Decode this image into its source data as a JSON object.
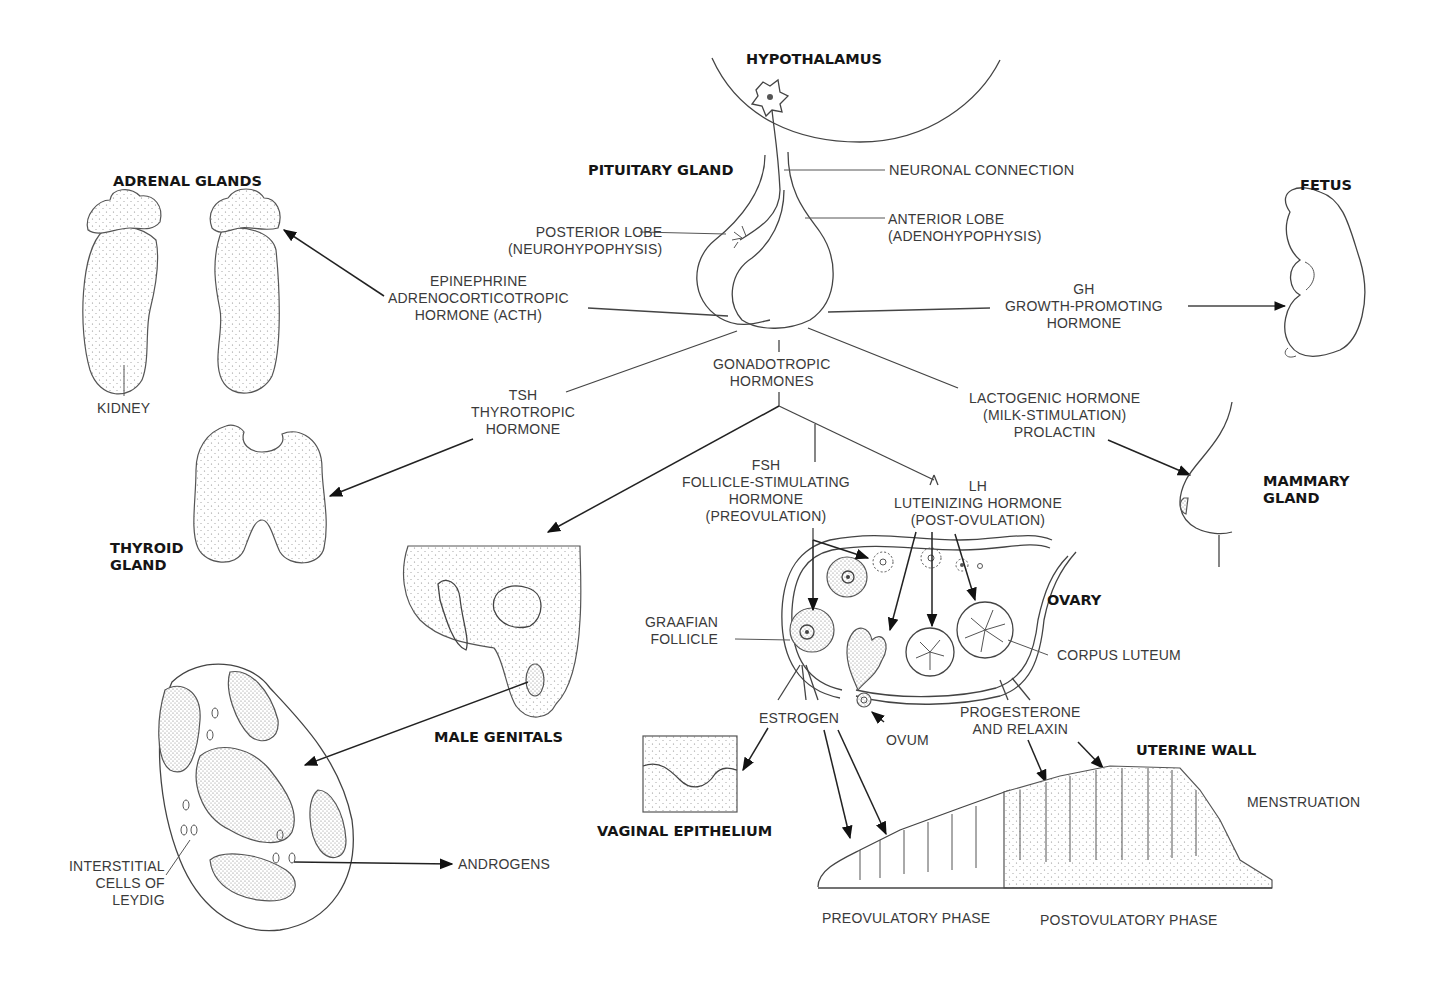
{
  "diagram": {
    "nodes": {
      "hypothalamus": "HYPOTHALAMUS",
      "pituitary": "PITUITARY GLAND",
      "neuronal_connection": "NEURONAL CONNECTION",
      "posterior_lobe": "POSTERIOR LOBE\n(NEUROHYPOPHYSIS)",
      "anterior_lobe": "ANTERIOR LOBE\n(ADENOHYPOPHYSIS)",
      "adrenal_glands": "ADRENAL GLANDS",
      "kidney": "KIDNEY",
      "thyroid_gland": "THYROID\nGLAND",
      "fetus": "FETUS",
      "mammary_gland": "MAMMARY\nGLAND",
      "male_genitals": "MALE GENITALS",
      "interstitial_cells": "INTERSTITIAL\nCELLS OF\nLEYDIG",
      "androgens": "ANDROGENS",
      "ovary": "OVARY",
      "graafian_follicle": "GRAAFIAN\nFOLLICLE",
      "corpus_luteum": "CORPUS LUTEUM",
      "ovum": "OVUM",
      "estrogen": "ESTROGEN",
      "progesterone": "PROGESTERONE\nAND RELAXIN",
      "vaginal_epithelium": "VAGINAL EPITHELIUM",
      "uterine_wall": "UTERINE WALL",
      "preovulatory_phase": "PREOVULATORY PHASE",
      "postovulatory_phase": "POSTOVULATORY PHASE",
      "menstruation": "MENSTRUATION"
    },
    "hormones": {
      "acth": "EPINEPHRINE\nADRENOCORTICOTROPIC\nHORMONE (ACTH)",
      "gh": "GH\nGROWTH-PROMOTING\nHORMONE",
      "tsh": "TSH\nTHYROTROPIC\nHORMONE",
      "gonadotropic": "GONADOTROPIC\nHORMONES",
      "lactogenic": "LACTOGENIC HORMONE\n(MILK-STIMULATION)\nPROLACTIN",
      "fsh": "FSH\nFOLLICLE-STIMULATING\nHORMONE\n(PREOVULATION)",
      "lh": "LH\nLUTEINIZING HORMONE\n(POST-OVULATION)"
    },
    "edges": [
      {
        "from": "pituitary",
        "to": "adrenal_glands",
        "label": "ACTH"
      },
      {
        "from": "pituitary",
        "to": "fetus",
        "label": "GH"
      },
      {
        "from": "pituitary",
        "to": "thyroid_gland",
        "label": "TSH"
      },
      {
        "from": "pituitary",
        "to": "mammary_gland",
        "label": "Prolactin"
      },
      {
        "from": "pituitary",
        "to": "male_genitals",
        "label": "Gonadotropic hormones"
      },
      {
        "from": "pituitary",
        "to": "ovary",
        "label": "FSH / LH"
      },
      {
        "from": "male_genitals",
        "to": "interstitial_cells",
        "label": ""
      },
      {
        "from": "interstitial_cells",
        "to": "androgens",
        "label": ""
      },
      {
        "from": "ovary",
        "to": "vaginal_epithelium",
        "label": "Estrogen"
      },
      {
        "from": "ovary",
        "to": "uterine_wall",
        "label": "Estrogen / Progesterone and relaxin"
      }
    ]
  }
}
